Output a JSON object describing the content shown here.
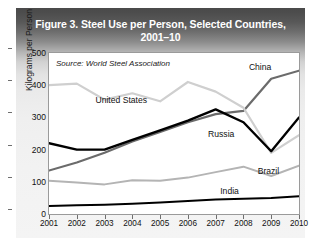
{
  "figure": {
    "title_line1": "Figure 3. Steel Use per Person, Selected Countries,",
    "title_line2": "2001–10",
    "source": "Source: World Steel Association"
  },
  "colors": {
    "header_dark": "#4a4a4a",
    "panel_bg": "#f1f1f1",
    "plot_bg": "#ffffff",
    "china": "#6b6b6b",
    "united_states": "#cfcfcf",
    "russia": "#000000",
    "brazil": "#b4b4b4",
    "india": "#000000",
    "axis": "#9a9a9a",
    "title_text": "#ffffff"
  },
  "chart_data": {
    "type": "line",
    "title": "Figure 3. Steel Use per Person, Selected Countries, 2001–10",
    "xlabel": "",
    "ylabel": "Kilograms per Person",
    "source": "Source: World Steel Association",
    "grid": false,
    "legend": "inline-labels",
    "x": [
      2001,
      2002,
      2003,
      2004,
      2005,
      2006,
      2007,
      2008,
      2009,
      2010
    ],
    "xlim": [
      2001,
      2010
    ],
    "ylim": [
      0,
      500
    ],
    "yticks": [
      0,
      100,
      200,
      300,
      400,
      500
    ],
    "xticks": [
      "2001",
      "2002",
      "2003",
      "2004",
      "2005",
      "2006",
      "2007",
      "2008",
      "2009",
      "2010"
    ],
    "series": [
      {
        "name": "China",
        "color": "#6b6b6b",
        "label_x": 2008.6,
        "label_y": 455,
        "values": [
          135,
          160,
          190,
          225,
          255,
          285,
          310,
          320,
          420,
          445
        ]
      },
      {
        "name": "United States",
        "color": "#cfcfcf",
        "label_x": 2003.6,
        "label_y": 355,
        "values": [
          400,
          405,
          355,
          375,
          350,
          410,
          380,
          330,
          190,
          245
        ]
      },
      {
        "name": "Russia",
        "color": "#000000",
        "label_x": 2007.2,
        "label_y": 250,
        "values": [
          220,
          200,
          200,
          230,
          260,
          290,
          325,
          285,
          195,
          300
        ]
      },
      {
        "name": "Brazil",
        "color": "#b4b4b4",
        "label_x": 2008.9,
        "label_y": 135,
        "values": [
          103,
          98,
          92,
          105,
          103,
          113,
          130,
          147,
          118,
          150
        ]
      },
      {
        "name": "India",
        "color": "#000000",
        "label_x": 2007.5,
        "label_y": 72,
        "values": [
          25,
          27,
          29,
          32,
          36,
          40,
          45,
          47,
          50,
          55
        ]
      }
    ]
  }
}
